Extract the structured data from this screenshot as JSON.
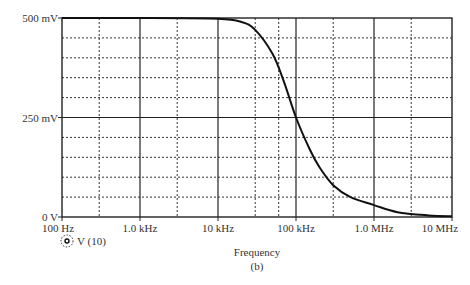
{
  "chart_data": {
    "type": "line",
    "title": "",
    "xlabel": "Frequency",
    "ylabel": "",
    "caption": "(b)",
    "x_scale": "log",
    "xlim": [
      100,
      10000000
    ],
    "ylim": [
      0,
      500
    ],
    "x_ticks": [
      "100 Hz",
      "1.0 kHz",
      "10 kHz",
      "100 kHz",
      "1.0 MHz",
      "10 MHz"
    ],
    "y_ticks": [
      "0 V",
      "250 mV",
      "500 mV"
    ],
    "grid": true,
    "legend": [
      {
        "marker": "dotted-circle",
        "label": "V (10)"
      }
    ],
    "series": [
      {
        "name": "V (10)",
        "x": [
          100,
          1000,
          10000,
          20000,
          30000,
          50000,
          70000,
          100000,
          150000,
          200000,
          300000,
          500000,
          1000000,
          2000000,
          5000000,
          10000000
        ],
        "values": [
          500,
          500,
          498,
          490,
          470,
          410,
          340,
          250,
          170,
          125,
          80,
          50,
          30,
          12,
          4,
          2
        ]
      }
    ]
  },
  "legend": {
    "label": "V (10)"
  },
  "axis": {
    "xlabel": "Frequency",
    "caption": "(b)",
    "x_ticks": [
      "100 Hz",
      "1.0 kHz",
      "10 kHz",
      "100 kHz",
      "1.0 MHz",
      "10 MHz"
    ],
    "y_ticks": [
      "0 V",
      "250 mV",
      "500 mV"
    ]
  }
}
